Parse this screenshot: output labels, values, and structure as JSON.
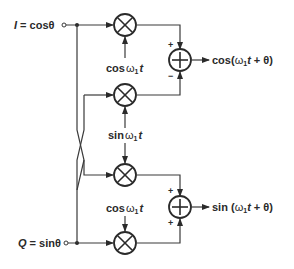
{
  "diagram": {
    "type": "quadrature-upconverter-block-diagram",
    "inputs": {
      "i": {
        "var": "I",
        "eq": " = cosθ"
      },
      "q": {
        "var": "Q",
        "eq": " = sinθ"
      }
    },
    "mixers": [
      {
        "id": "mixer-1",
        "lo_label": {
          "fn": "cos",
          "w": "ω",
          "sub": "1",
          "t": "t"
        }
      },
      {
        "id": "mixer-2",
        "lo_label": {
          "fn": "sin",
          "w": "ω",
          "sub": "1",
          "t": "t"
        }
      },
      {
        "id": "mixer-3"
      },
      {
        "id": "mixer-4",
        "lo_label": {
          "fn": "cos",
          "w": "ω",
          "sub": "1",
          "t": "t"
        }
      }
    ],
    "adders": [
      {
        "id": "adder-1",
        "top_sign": "+",
        "bottom_sign": "−",
        "output": {
          "pre": "cos(",
          "w": "ω",
          "sub": "1",
          "t": "t",
          "post": " + θ)"
        }
      },
      {
        "id": "adder-2",
        "top_sign": "+",
        "bottom_sign": "+",
        "output": {
          "pre": "sin (",
          "w": "ω",
          "sub": "1",
          "t": "t",
          "post": " + θ)"
        }
      }
    ],
    "symbols": {
      "mixer": "⊗",
      "adder": "⊕"
    }
  }
}
